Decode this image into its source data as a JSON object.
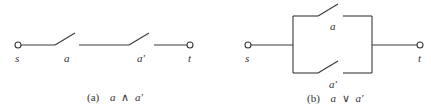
{
  "diagram_a": {
    "caption_tag": "(a)",
    "caption_expr_left": "a",
    "caption_op": "∧",
    "caption_expr_right": "a'",
    "labels": {
      "source": "s",
      "switch1": "a",
      "switch2": "a'",
      "sink": "t"
    },
    "type": "series"
  },
  "diagram_b": {
    "caption_tag": "(b)",
    "caption_expr_left": "a",
    "caption_op": "∨",
    "caption_expr_right": "a'",
    "labels": {
      "source": "s",
      "switch_top": "a",
      "switch_bottom": "a'",
      "sink": "t"
    },
    "type": "parallel"
  },
  "colors": {
    "line": "#3a3a3a",
    "text": "#333333",
    "background": "#ffffff"
  }
}
